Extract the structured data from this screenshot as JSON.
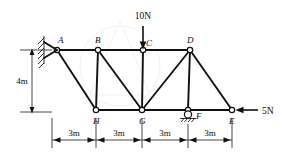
{
  "figure": {
    "background_color": "#ffffff",
    "line_color": "#111111"
  },
  "loads": {
    "vertical": {
      "label": "10N",
      "magnitude": 10,
      "unit": "N",
      "direction": "down",
      "applied_at": "C"
    },
    "horizontal": {
      "label": "5N",
      "magnitude": 5,
      "unit": "N",
      "direction": "left",
      "applied_at": "E"
    }
  },
  "joints": {
    "A": {
      "label": "A",
      "x": 57,
      "y": 50
    },
    "B": {
      "label": "B",
      "x": 98,
      "y": 50
    },
    "C": {
      "label": "C",
      "x": 143,
      "y": 50
    },
    "D": {
      "label": "D",
      "x": 190,
      "y": 50
    },
    "E": {
      "label": "E",
      "x": 232,
      "y": 110
    },
    "F": {
      "label": "F",
      "x": 188,
      "y": 110
    },
    "G": {
      "label": "G",
      "x": 142,
      "y": 110
    },
    "H": {
      "label": "H",
      "x": 96,
      "y": 110
    }
  },
  "supports": {
    "pin": {
      "at": "A",
      "type": "pin-fixed-wall",
      "icon": "hatched-wall-pin-icon"
    },
    "roller": {
      "at": "F",
      "type": "roller",
      "icon": "roller-support-icon"
    }
  },
  "dimensions": {
    "height": {
      "label": "4m",
      "value": 4,
      "unit": "m",
      "orientation": "vertical"
    },
    "spans": [
      {
        "label": "3m",
        "value": 3,
        "unit": "m",
        "from": "A",
        "to": "H"
      },
      {
        "label": "3m",
        "value": 3,
        "unit": "m",
        "from": "H",
        "to": "G"
      },
      {
        "label": "3m",
        "value": 3,
        "unit": "m",
        "from": "G",
        "to": "F"
      },
      {
        "label": "3m",
        "value": 3,
        "unit": "m",
        "from": "F",
        "to": "E"
      }
    ]
  },
  "members": [
    {
      "from": "A",
      "to": "B"
    },
    {
      "from": "B",
      "to": "C"
    },
    {
      "from": "C",
      "to": "D"
    },
    {
      "from": "H",
      "to": "G"
    },
    {
      "from": "G",
      "to": "F"
    },
    {
      "from": "F",
      "to": "E"
    },
    {
      "from": "B",
      "to": "H"
    },
    {
      "from": "C",
      "to": "G"
    },
    {
      "from": "D",
      "to": "F"
    },
    {
      "from": "A",
      "to": "H"
    },
    {
      "from": "B",
      "to": "G"
    },
    {
      "from": "D",
      "to": "G"
    },
    {
      "from": "D",
      "to": "E"
    }
  ]
}
